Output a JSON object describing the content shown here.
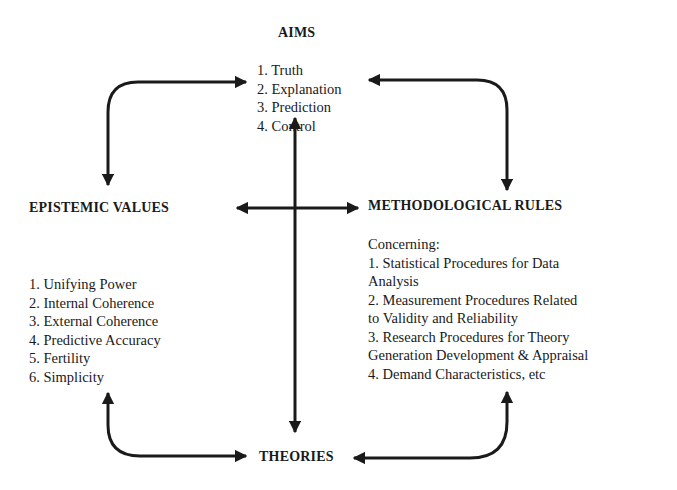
{
  "diagram": {
    "nodes": {
      "aims": {
        "title": "AIMS",
        "items": [
          "1. Truth",
          "2. Explanation",
          "3. Prediction",
          "4. Control"
        ]
      },
      "epistemic_values": {
        "title": "EPISTEMIC VALUES",
        "items": [
          "1. Unifying Power",
          "2. Internal Coherence",
          "3. External Coherence",
          "4. Predictive Accuracy",
          "5. Fertility",
          "6. Simplicity"
        ]
      },
      "methodological_rules": {
        "title": "METHODOLOGICAL RULES",
        "intro": "Concerning:",
        "items": [
          {
            "line1": "1. Statistical Procedures for Data",
            "line2": "Analysis"
          },
          {
            "line1": "2. Measurement Procedures Related",
            "line2": "to Validity and Reliability"
          },
          {
            "line1": "3. Research Procedures for Theory",
            "line2": "Generation Development & Appraisal"
          },
          {
            "line1": "4. Demand Characteristics, etc",
            "line2": ""
          }
        ]
      },
      "theories": {
        "title": "THEORIES"
      }
    },
    "edges": [
      {
        "from": "AIMS",
        "to": "EPISTEMIC VALUES",
        "type": "bidirectional-curved"
      },
      {
        "from": "AIMS",
        "to": "METHODOLOGICAL RULES",
        "type": "bidirectional-curved"
      },
      {
        "from": "AIMS",
        "to": "THEORIES",
        "type": "bidirectional-straight"
      },
      {
        "from": "EPISTEMIC VALUES",
        "to": "METHODOLOGICAL RULES",
        "type": "bidirectional-straight"
      },
      {
        "from": "EPISTEMIC VALUES",
        "to": "THEORIES",
        "type": "bidirectional-curved"
      },
      {
        "from": "METHODOLOGICAL RULES",
        "to": "THEORIES",
        "type": "bidirectional-curved"
      }
    ],
    "colors": {
      "ink": "#1a1a1a",
      "background": "#ffffff"
    }
  }
}
